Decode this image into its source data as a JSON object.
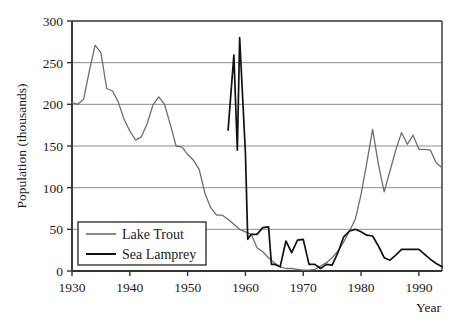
{
  "chart_data": {
    "type": "line",
    "title": "",
    "xlabel": "Year",
    "ylabel": "Population (thousands)",
    "xlim": [
      1930,
      1994
    ],
    "ylim": [
      0,
      300
    ],
    "y_ticks": [
      0,
      50,
      100,
      150,
      200,
      250,
      300
    ],
    "x_ticks": [
      1930,
      1940,
      1950,
      1960,
      1970,
      1980,
      1990
    ],
    "y_tick_labels": [
      "0",
      "50",
      "100",
      "150",
      "200",
      "250",
      "300"
    ],
    "x_tick_labels": [
      "1930",
      "1940",
      "1950",
      "1960",
      "1970",
      "1980",
      "1990"
    ],
    "grid": "horizontal",
    "legend_position": "bottom-left",
    "colors": {
      "lake_trout": "#6e6e6e",
      "sea_lamprey": "#111111",
      "gridline": "#8c8c8c",
      "axis": "#333333",
      "background": "#ffffff"
    },
    "series": [
      {
        "name": "Lake Trout",
        "color": "#6e6e6e",
        "points": [
          [
            1930,
            202
          ],
          [
            1931,
            200
          ],
          [
            1932,
            206
          ],
          [
            1933,
            240
          ],
          [
            1934,
            271
          ],
          [
            1935,
            262
          ],
          [
            1936,
            219
          ],
          [
            1937,
            216
          ],
          [
            1938,
            203
          ],
          [
            1939,
            182
          ],
          [
            1940,
            168
          ],
          [
            1941,
            157
          ],
          [
            1942,
            161
          ],
          [
            1943,
            177
          ],
          [
            1944,
            199
          ],
          [
            1945,
            209
          ],
          [
            1946,
            200
          ],
          [
            1947,
            176
          ],
          [
            1948,
            150
          ],
          [
            1949,
            149
          ],
          [
            1950,
            140
          ],
          [
            1951,
            133
          ],
          [
            1952,
            122
          ],
          [
            1953,
            93
          ],
          [
            1954,
            76
          ],
          [
            1955,
            67
          ],
          [
            1956,
            67
          ],
          [
            1957,
            62
          ],
          [
            1958,
            56
          ],
          [
            1959,
            50
          ],
          [
            1960,
            47
          ],
          [
            1961,
            44
          ],
          [
            1962,
            28
          ],
          [
            1963,
            23
          ],
          [
            1964,
            16
          ],
          [
            1965,
            10
          ],
          [
            1966,
            5
          ],
          [
            1967,
            3
          ],
          [
            1968,
            3
          ],
          [
            1969,
            2
          ],
          [
            1970,
            1
          ],
          [
            1971,
            1
          ],
          [
            1972,
            2
          ],
          [
            1973,
            6
          ],
          [
            1974,
            10
          ],
          [
            1975,
            16
          ],
          [
            1976,
            24
          ],
          [
            1977,
            35
          ],
          [
            1978,
            48
          ],
          [
            1979,
            62
          ],
          [
            1980,
            92
          ],
          [
            1981,
            130
          ],
          [
            1982,
            170
          ],
          [
            1983,
            128
          ],
          [
            1984,
            95
          ],
          [
            1985,
            120
          ],
          [
            1986,
            145
          ],
          [
            1987,
            166
          ],
          [
            1988,
            152
          ],
          [
            1989,
            163
          ],
          [
            1990,
            146
          ],
          [
            1991,
            146
          ],
          [
            1992,
            145
          ],
          [
            1993,
            130
          ],
          [
            1994,
            124
          ]
        ]
      },
      {
        "name": "Sea Lamprey",
        "color": "#111111",
        "points": [
          [
            1957,
            169
          ],
          [
            1958,
            259
          ],
          [
            1958.6,
            145
          ],
          [
            1959,
            280
          ],
          [
            1960,
            141
          ],
          [
            1960.4,
            38
          ],
          [
            1961,
            44
          ],
          [
            1962,
            44
          ],
          [
            1963,
            52
          ],
          [
            1964,
            53
          ],
          [
            1964.5,
            8
          ],
          [
            1965,
            8
          ],
          [
            1966,
            5
          ],
          [
            1967,
            36
          ],
          [
            1968,
            22
          ],
          [
            1969,
            37
          ],
          [
            1970,
            38
          ],
          [
            1971,
            8
          ],
          [
            1972,
            8
          ],
          [
            1973,
            3
          ],
          [
            1974,
            8
          ],
          [
            1975,
            7
          ],
          [
            1976,
            22
          ],
          [
            1977,
            41
          ],
          [
            1978,
            48
          ],
          [
            1979,
            50
          ],
          [
            1980,
            47
          ],
          [
            1981,
            43
          ],
          [
            1982,
            42
          ],
          [
            1983,
            30
          ],
          [
            1984,
            16
          ],
          [
            1985,
            13
          ],
          [
            1986,
            19
          ],
          [
            1987,
            26
          ],
          [
            1988,
            26
          ],
          [
            1989,
            26
          ],
          [
            1990,
            26
          ],
          [
            1991,
            20
          ],
          [
            1992,
            14
          ],
          [
            1993,
            9
          ],
          [
            1994,
            5
          ]
        ]
      }
    ]
  },
  "legend": {
    "entries": [
      {
        "label": "Lake Trout",
        "color": "#6e6e6e"
      },
      {
        "label": "Sea Lamprey",
        "color": "#111111"
      }
    ]
  },
  "axes": {
    "y_title": "Population (thousands)",
    "x_title": "Year"
  }
}
